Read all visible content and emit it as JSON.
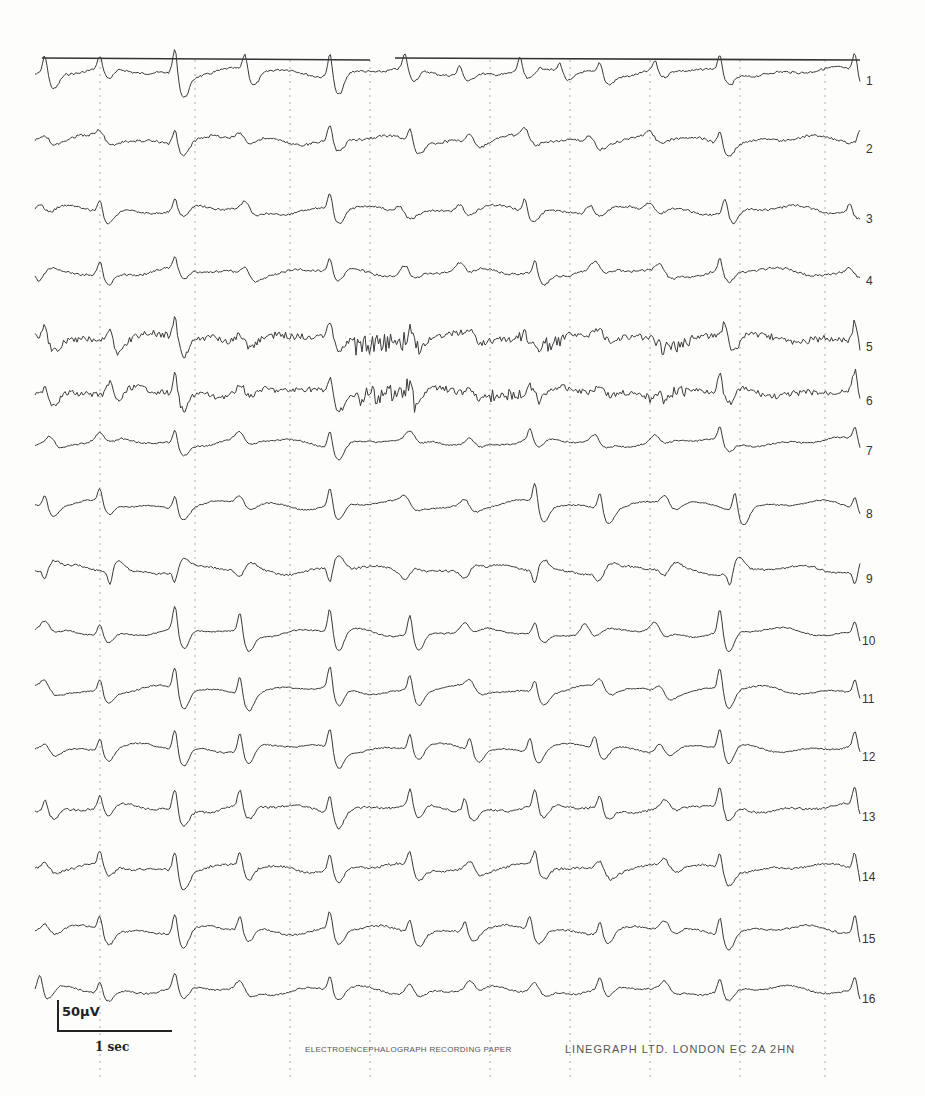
{
  "recording": {
    "type": "EEG paper recording (scanned)",
    "channel_count": 16,
    "channels": [
      {
        "label": "1",
        "y": 72,
        "noise": 1.2,
        "spikes": [
          [
            45,
            -20,
            "sw"
          ],
          [
            100,
            -14,
            "sw"
          ],
          [
            175,
            -28,
            "sw"
          ],
          [
            245,
            -18,
            "sw"
          ],
          [
            330,
            -26,
            "sw"
          ],
          [
            405,
            -16,
            "sw"
          ],
          [
            460,
            -10,
            "sw"
          ],
          [
            520,
            -14,
            "sw"
          ],
          [
            560,
            -10,
            "sw"
          ],
          [
            600,
            -12,
            "sw"
          ],
          [
            655,
            -10,
            "sw"
          ],
          [
            720,
            -16,
            "sw"
          ],
          [
            855,
            -20,
            "sw"
          ]
        ]
      },
      {
        "label": "2",
        "y": 140,
        "noise": 1.4,
        "spikes": [
          [
            45,
            -8,
            "w"
          ],
          [
            100,
            -10,
            "w"
          ],
          [
            175,
            -16,
            "sw"
          ],
          [
            240,
            -10,
            "w"
          ],
          [
            330,
            -16,
            "sw"
          ],
          [
            410,
            -14,
            "sw"
          ],
          [
            470,
            -10,
            "w"
          ],
          [
            525,
            -12,
            "w"
          ],
          [
            590,
            -10,
            "w"
          ],
          [
            650,
            -10,
            "w"
          ],
          [
            720,
            -14,
            "sw"
          ],
          [
            860,
            -16,
            "sw"
          ]
        ]
      },
      {
        "label": "3",
        "y": 210,
        "noise": 1.2,
        "spikes": [
          [
            40,
            -8,
            "w"
          ],
          [
            100,
            -14,
            "sw"
          ],
          [
            175,
            -12,
            "sw"
          ],
          [
            245,
            -10,
            "w"
          ],
          [
            330,
            -18,
            "sw"
          ],
          [
            400,
            -10,
            "w"
          ],
          [
            460,
            -10,
            "w"
          ],
          [
            525,
            -14,
            "sw"
          ],
          [
            590,
            -12,
            "w"
          ],
          [
            650,
            -10,
            "w"
          ],
          [
            725,
            -16,
            "sw"
          ],
          [
            850,
            -10,
            "sw"
          ]
        ]
      },
      {
        "label": "4",
        "y": 272,
        "noise": 1.2,
        "spikes": [
          [
            30,
            -16,
            "sw"
          ],
          [
            100,
            -14,
            "sw"
          ],
          [
            175,
            -12,
            "sw"
          ],
          [
            245,
            -10,
            "w"
          ],
          [
            330,
            -14,
            "sw"
          ],
          [
            405,
            -12,
            "w"
          ],
          [
            460,
            -10,
            "w"
          ],
          [
            535,
            -14,
            "sw"
          ],
          [
            595,
            -10,
            "w"
          ],
          [
            660,
            -10,
            "w"
          ],
          [
            720,
            -14,
            "sw"
          ],
          [
            850,
            -8,
            "w"
          ]
        ]
      },
      {
        "label": "5",
        "y": 338,
        "noise": 3.4,
        "burst": [
          [
            355,
            420,
            10
          ],
          [
            520,
            560,
            8
          ],
          [
            650,
            690,
            6
          ]
        ],
        "spikes": [
          [
            45,
            -14,
            "sw"
          ],
          [
            110,
            -16,
            "sw"
          ],
          [
            175,
            -22,
            "sw"
          ],
          [
            240,
            -12,
            "w"
          ],
          [
            330,
            -18,
            "sw"
          ],
          [
            410,
            -14,
            "sw"
          ],
          [
            470,
            -8,
            "w"
          ],
          [
            525,
            -12,
            "w"
          ],
          [
            600,
            -10,
            "w"
          ],
          [
            655,
            -8,
            "w"
          ],
          [
            725,
            -18,
            "sw"
          ],
          [
            855,
            -20,
            "sw"
          ]
        ]
      },
      {
        "label": "6",
        "y": 392,
        "noise": 3.0,
        "burst": [
          [
            355,
            415,
            10
          ],
          [
            490,
            540,
            6
          ],
          [
            650,
            690,
            5
          ]
        ],
        "spikes": [
          [
            45,
            -12,
            "sw"
          ],
          [
            110,
            -14,
            "sw"
          ],
          [
            175,
            -22,
            "sw"
          ],
          [
            240,
            -12,
            "w"
          ],
          [
            330,
            -18,
            "sw"
          ],
          [
            410,
            -16,
            "sw"
          ],
          [
            470,
            -10,
            "w"
          ],
          [
            530,
            -12,
            "w"
          ],
          [
            600,
            -10,
            "w"
          ],
          [
            655,
            -8,
            "w"
          ],
          [
            720,
            -18,
            "sw"
          ],
          [
            855,
            -20,
            "sw"
          ]
        ]
      },
      {
        "label": "7",
        "y": 442,
        "noise": 0.8,
        "spikes": [
          [
            50,
            -10,
            "w"
          ],
          [
            100,
            -10,
            "w"
          ],
          [
            175,
            -14,
            "sw"
          ],
          [
            240,
            -10,
            "w"
          ],
          [
            330,
            -18,
            "sw"
          ],
          [
            410,
            -10,
            "w"
          ],
          [
            470,
            -8,
            "w"
          ],
          [
            530,
            -12,
            "sw"
          ],
          [
            595,
            -10,
            "w"
          ],
          [
            655,
            -8,
            "w"
          ],
          [
            720,
            -14,
            "sw"
          ],
          [
            855,
            -14,
            "sw"
          ]
        ]
      },
      {
        "label": "8",
        "y": 505,
        "noise": 0.7,
        "spikes": [
          [
            45,
            -12,
            "sw"
          ],
          [
            100,
            -14,
            "sw"
          ],
          [
            175,
            -14,
            "sw"
          ],
          [
            240,
            -12,
            "w"
          ],
          [
            330,
            -20,
            "sw"
          ],
          [
            405,
            -10,
            "w"
          ],
          [
            465,
            -10,
            "w"
          ],
          [
            535,
            -22,
            "sw"
          ],
          [
            600,
            -18,
            "sw"
          ],
          [
            665,
            -12,
            "w"
          ],
          [
            735,
            -20,
            "sw"
          ],
          [
            855,
            -12,
            "sw"
          ]
        ]
      },
      {
        "label": "9",
        "y": 570,
        "noise": 1.1,
        "spikes": [
          [
            45,
            10,
            "sw"
          ],
          [
            110,
            14,
            "sw"
          ],
          [
            175,
            12,
            "sw"
          ],
          [
            240,
            12,
            "w"
          ],
          [
            330,
            16,
            "sw"
          ],
          [
            405,
            10,
            "w"
          ],
          [
            465,
            10,
            "w"
          ],
          [
            535,
            14,
            "sw"
          ],
          [
            600,
            12,
            "w"
          ],
          [
            665,
            10,
            "w"
          ],
          [
            730,
            16,
            "sw"
          ],
          [
            855,
            14,
            "sw"
          ]
        ]
      },
      {
        "label": "10",
        "y": 632,
        "noise": 0.7,
        "spikes": [
          [
            45,
            -10,
            "w"
          ],
          [
            100,
            -12,
            "sw"
          ],
          [
            175,
            -26,
            "sw"
          ],
          [
            240,
            -22,
            "sw"
          ],
          [
            330,
            -26,
            "sw"
          ],
          [
            410,
            -22,
            "sw"
          ],
          [
            465,
            -10,
            "w"
          ],
          [
            535,
            -12,
            "sw"
          ],
          [
            585,
            -14,
            "w"
          ],
          [
            655,
            -12,
            "w"
          ],
          [
            720,
            -26,
            "sw"
          ],
          [
            855,
            -14,
            "sw"
          ]
        ]
      },
      {
        "label": "11",
        "y": 690,
        "noise": 0.7,
        "spikes": [
          [
            45,
            -10,
            "w"
          ],
          [
            100,
            -14,
            "sw"
          ],
          [
            175,
            -24,
            "sw"
          ],
          [
            240,
            -20,
            "sw"
          ],
          [
            330,
            -24,
            "sw"
          ],
          [
            410,
            -18,
            "sw"
          ],
          [
            470,
            -10,
            "w"
          ],
          [
            535,
            -14,
            "sw"
          ],
          [
            600,
            -12,
            "w"
          ],
          [
            660,
            -10,
            "w"
          ],
          [
            720,
            -24,
            "sw"
          ],
          [
            855,
            -14,
            "sw"
          ]
        ]
      },
      {
        "label": "12",
        "y": 748,
        "noise": 0.7,
        "spikes": [
          [
            45,
            -10,
            "w"
          ],
          [
            100,
            -14,
            "sw"
          ],
          [
            175,
            -22,
            "sw"
          ],
          [
            240,
            -20,
            "sw"
          ],
          [
            330,
            -22,
            "sw"
          ],
          [
            410,
            -16,
            "sw"
          ],
          [
            470,
            -14,
            "sw"
          ],
          [
            530,
            -16,
            "sw"
          ],
          [
            595,
            -14,
            "sw"
          ],
          [
            660,
            -12,
            "w"
          ],
          [
            720,
            -22,
            "sw"
          ],
          [
            855,
            -16,
            "sw"
          ]
        ]
      },
      {
        "label": "13",
        "y": 808,
        "noise": 1.2,
        "spikes": [
          [
            45,
            -12,
            "sw"
          ],
          [
            100,
            -14,
            "sw"
          ],
          [
            175,
            -22,
            "sw"
          ],
          [
            240,
            -18,
            "sw"
          ],
          [
            330,
            -20,
            "sw"
          ],
          [
            410,
            -18,
            "sw"
          ],
          [
            465,
            -14,
            "sw"
          ],
          [
            535,
            -18,
            "sw"
          ],
          [
            600,
            -14,
            "sw"
          ],
          [
            665,
            -10,
            "w"
          ],
          [
            720,
            -20,
            "sw"
          ],
          [
            855,
            -20,
            "sw"
          ]
        ]
      },
      {
        "label": "14",
        "y": 868,
        "noise": 1.3,
        "spikes": [
          [
            45,
            -8,
            "w"
          ],
          [
            100,
            -14,
            "sw"
          ],
          [
            175,
            -22,
            "sw"
          ],
          [
            240,
            -16,
            "sw"
          ],
          [
            330,
            -18,
            "sw"
          ],
          [
            410,
            -16,
            "sw"
          ],
          [
            470,
            -12,
            "w"
          ],
          [
            535,
            -16,
            "sw"
          ],
          [
            600,
            -14,
            "w"
          ],
          [
            665,
            -10,
            "w"
          ],
          [
            720,
            -18,
            "sw"
          ],
          [
            855,
            -20,
            "sw"
          ]
        ]
      },
      {
        "label": "15",
        "y": 930,
        "noise": 1.0,
        "spikes": [
          [
            45,
            -10,
            "w"
          ],
          [
            100,
            -16,
            "sw"
          ],
          [
            175,
            -22,
            "sw"
          ],
          [
            240,
            -16,
            "sw"
          ],
          [
            330,
            -20,
            "sw"
          ],
          [
            410,
            -16,
            "sw"
          ],
          [
            465,
            -12,
            "sw"
          ],
          [
            530,
            -16,
            "sw"
          ],
          [
            600,
            -14,
            "sw"
          ],
          [
            665,
            -12,
            "w"
          ],
          [
            720,
            -20,
            "sw"
          ],
          [
            855,
            -20,
            "sw"
          ]
        ]
      },
      {
        "label": "16",
        "y": 990,
        "noise": 0.9,
        "spikes": [
          [
            40,
            -16,
            "sw"
          ],
          [
            100,
            -12,
            "sw"
          ],
          [
            175,
            -16,
            "sw"
          ],
          [
            240,
            -12,
            "w"
          ],
          [
            330,
            -14,
            "sw"
          ],
          [
            410,
            -12,
            "w"
          ],
          [
            470,
            -10,
            "w"
          ],
          [
            535,
            -12,
            "w"
          ],
          [
            600,
            -12,
            "sw"
          ],
          [
            665,
            -10,
            "w"
          ],
          [
            720,
            -14,
            "sw"
          ],
          [
            855,
            -16,
            "sw"
          ]
        ]
      }
    ]
  },
  "timing_line": {
    "y": 58,
    "segments": [
      [
        42,
        370
      ],
      [
        395,
        860
      ]
    ]
  },
  "time_markers_x": [
    100,
    195,
    290,
    370,
    490,
    570,
    650,
    740,
    825
  ],
  "calibration": {
    "voltage_label": "50µV",
    "time_label": "1 sec"
  },
  "footer": {
    "paper_label": "ELECTROENCEPHALOGRAPH RECORDING PAPER",
    "manufacturer": "LINEGRAPH LTD. LONDON EC 2A 2HN"
  },
  "colors": {
    "ink": "#3a3a3a",
    "marker": "#9a9a9a",
    "paper": "#fdfdfc"
  }
}
